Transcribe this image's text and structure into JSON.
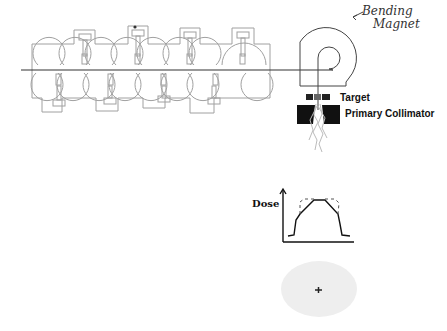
{
  "labels": {
    "bending_magnet_line1": "Bending",
    "bending_magnet_line2": "Magnet",
    "target": "Target",
    "primary_collimator": "Primary Collimator",
    "dose_axis": "Dose"
  },
  "components": [
    {
      "name": "linear-accelerator-waveguide",
      "cavities_top": 8,
      "cavities_bottom": 8
    },
    {
      "name": "electron-beam-line"
    },
    {
      "name": "bending-magnet"
    },
    {
      "name": "target"
    },
    {
      "name": "primary-collimator"
    },
    {
      "name": "xray-beam"
    },
    {
      "name": "dose-profile-plot"
    },
    {
      "name": "beam-field-spot"
    }
  ],
  "colors": {
    "waveguide_stroke": "#9a9a9a",
    "beam_line": "#333333",
    "collimator": "#111111",
    "field_spot": "#eeeeee"
  }
}
